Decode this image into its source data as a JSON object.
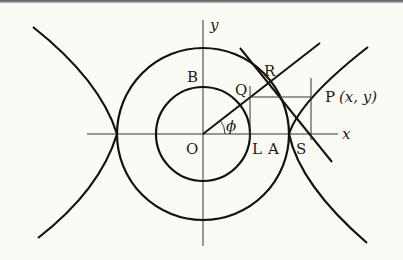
{
  "figure": {
    "labels": {
      "y_axis": "y",
      "x_axis": "x",
      "origin": "O",
      "B": "B",
      "Q": "Q",
      "R": "R",
      "P": "P",
      "P_coords": "(x, y)",
      "phi": "ϕ",
      "L": "L",
      "A": "A",
      "S": "S"
    },
    "colors": {
      "stroke": "#111111",
      "thin_stroke": "#333333",
      "background": "#fbfbf6"
    },
    "geometry": {
      "origin": [
        203,
        134
      ],
      "inner_radius": 47,
      "outer_radius": 86,
      "angle_phi_deg": 40
    }
  }
}
